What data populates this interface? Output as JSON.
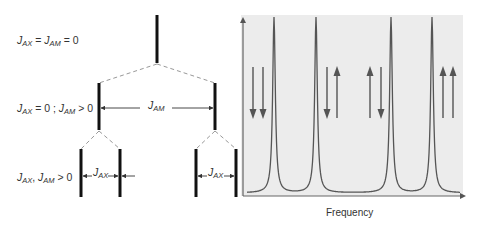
{
  "levels": [
    {
      "condition": {
        "symbol1": "J",
        "sub1": "AX",
        "rel1": " = ",
        "symbol2": "J",
        "sub2": "AM",
        "rel2": " = 0"
      }
    },
    {
      "condition": {
        "symbol1": "J",
        "sub1": "AX",
        "rel1": " = 0 ; ",
        "symbol2": "J",
        "sub2": "AM",
        "rel2": " > 0"
      }
    },
    {
      "condition": {
        "symbol1": "J",
        "sub1": "AX",
        "rel1": ", ",
        "symbol2": "J",
        "sub2": "AM",
        "rel2": " > 0"
      }
    }
  ],
  "splittings": {
    "jam": {
      "symbol": "J",
      "sub": "AM"
    },
    "jax_left": {
      "symbol": "J",
      "sub": "AX"
    },
    "jax_right": {
      "symbol": "J",
      "sub": "AX"
    }
  },
  "spectrum": {
    "xlabel": "Frequency",
    "peaks": [
      {
        "spin_states": [
          "down",
          "down"
        ]
      },
      {
        "spin_states": [
          "down",
          "up"
        ]
      },
      {
        "spin_states": [
          "up",
          "down"
        ]
      },
      {
        "spin_states": [
          "up",
          "up"
        ]
      }
    ],
    "colors": {
      "background": "#ececec",
      "line": "#555555",
      "arrow": "#555555",
      "stick": "#111111",
      "dash": "#999999"
    }
  }
}
